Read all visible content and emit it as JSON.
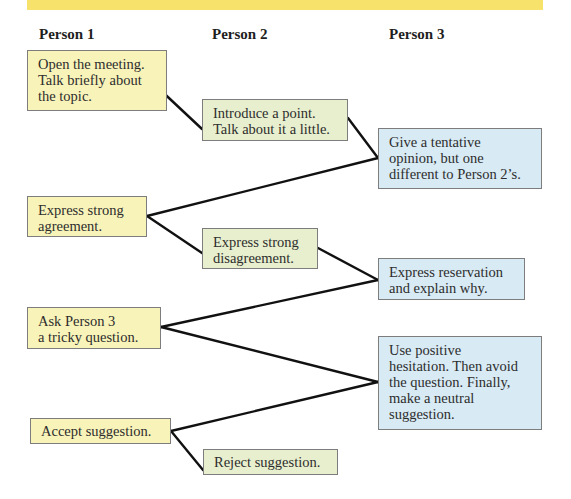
{
  "colors": {
    "top_band": "#f7e36c",
    "person1_box": "#f8f3b9",
    "person2_box": "#e8efce",
    "person3_box": "#d8eaf4",
    "box_border": "#7d7d7d",
    "connector": "#111111"
  },
  "columns": [
    {
      "label": "Person 1"
    },
    {
      "label": "Person 2"
    },
    {
      "label": "Person 3"
    }
  ],
  "steps": [
    {
      "person": 1,
      "text": "Open the meeting.\nTalk briefly about\nthe topic."
    },
    {
      "person": 2,
      "text": "Introduce a point.\nTalk about it a little."
    },
    {
      "person": 3,
      "text": "Give a tentative\nopinion, but one\ndifferent to Person 2’s."
    },
    {
      "person": 1,
      "text": "Express strong\nagreement."
    },
    {
      "person": 2,
      "text": "Express strong\ndisagreement."
    },
    {
      "person": 3,
      "text": "Express reservation\nand explain why."
    },
    {
      "person": 1,
      "text": "Ask Person 3\na tricky question."
    },
    {
      "person": 3,
      "text": "Use positive\nhesitation. Then avoid\nthe question. Finally,\nmake a neutral\nsuggestion."
    },
    {
      "person": 1,
      "text": "Accept suggestion."
    },
    {
      "person": 2,
      "text": "Reject suggestion."
    }
  ],
  "connections": [
    {
      "from": 0,
      "to": 1
    },
    {
      "from": 1,
      "to": 2
    },
    {
      "from": 2,
      "to": 3
    },
    {
      "from": 3,
      "to": 4
    },
    {
      "from": 4,
      "to": 5
    },
    {
      "from": 5,
      "to": 6
    },
    {
      "from": 6,
      "to": 7
    },
    {
      "from": 7,
      "to": 8
    },
    {
      "from": 8,
      "to": 9
    }
  ]
}
